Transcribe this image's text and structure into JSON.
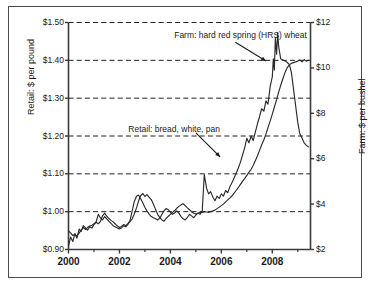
{
  "chart_data": {
    "type": "line",
    "title": "",
    "xlabel": "",
    "ylabel": "Retail: $ per pound",
    "y2label": "Farm: $ per bushel",
    "xlim": [
      2000.0,
      2009.5
    ],
    "ylim": [
      0.9,
      1.5
    ],
    "y2lim": [
      2,
      12
    ],
    "grid": true,
    "grid_style": "dashed-horizontal",
    "legend_position": "inline-annotations",
    "xticks": [
      2000,
      2002,
      2004,
      2006,
      2008
    ],
    "xticklabels": [
      "2000",
      "2002",
      "2004",
      "2006",
      "2008"
    ],
    "xminorticks": [
      2001,
      2003,
      2005,
      2007,
      2009
    ],
    "yticks": [
      0.9,
      1.0,
      1.1,
      1.2,
      1.3,
      1.4,
      1.5
    ],
    "yticklabels": [
      "$0.90",
      "$1.00",
      "$1.10",
      "$1.20",
      "$1.30",
      "$1.40",
      "$1.50"
    ],
    "y2ticks": [
      2,
      4,
      6,
      8,
      10,
      12
    ],
    "y2ticklabels": [
      "$2",
      "$4",
      "$6",
      "$8",
      "$10",
      "$12"
    ],
    "annotations": [
      {
        "text": "Farm: hard red spring (HRS) wheat",
        "text_x": 2004.15,
        "text_y": 1.463,
        "arrow_from_x": 2006.55,
        "arrow_from_y": 1.448,
        "arrow_to_x": 2007.75,
        "arrow_to_y": 1.398
      },
      {
        "text": "Retail: bread, white, pan",
        "text_x": 2002.35,
        "text_y": 1.215,
        "arrow_from_x": 2005.0,
        "arrow_from_y": 1.208,
        "arrow_to_x": 2005.95,
        "arrow_to_y": 1.145
      }
    ],
    "series": [
      {
        "name": "Retail: bread, white, pan",
        "axis": "left",
        "unit": "$ per pound",
        "color": "#2b2b2b",
        "x": [
          2000.0,
          2000.08,
          2000.17,
          2000.25,
          2000.33,
          2000.42,
          2000.5,
          2000.58,
          2000.67,
          2000.75,
          2000.83,
          2000.92,
          2001.0,
          2001.08,
          2001.17,
          2001.25,
          2001.33,
          2001.42,
          2001.5,
          2001.58,
          2001.67,
          2001.75,
          2001.83,
          2001.92,
          2002.0,
          2002.08,
          2002.17,
          2002.25,
          2002.33,
          2002.42,
          2002.5,
          2002.58,
          2002.67,
          2002.75,
          2002.83,
          2002.92,
          2003.0,
          2003.08,
          2003.17,
          2003.25,
          2003.33,
          2003.42,
          2003.5,
          2003.58,
          2003.67,
          2003.75,
          2003.83,
          2003.92,
          2004.0,
          2004.08,
          2004.17,
          2004.25,
          2004.33,
          2004.42,
          2004.5,
          2004.58,
          2004.67,
          2004.75,
          2004.83,
          2004.92,
          2005.0,
          2005.08,
          2005.17,
          2005.25,
          2005.33,
          2005.42,
          2005.5,
          2005.58,
          2005.67,
          2005.75,
          2005.83,
          2005.92,
          2006.0,
          2006.08,
          2006.17,
          2006.25,
          2006.33,
          2006.42,
          2006.5,
          2006.58,
          2006.67,
          2006.75,
          2006.83,
          2006.92,
          2007.0,
          2007.08,
          2007.17,
          2007.25,
          2007.33,
          2007.42,
          2007.5,
          2007.58,
          2007.67,
          2007.75,
          2007.83,
          2007.92,
          2008.0,
          2008.08,
          2008.17,
          2008.25,
          2008.33,
          2008.42,
          2008.5,
          2008.58,
          2008.67,
          2008.75,
          2008.83,
          2008.92,
          2009.0,
          2009.08,
          2009.17,
          2009.25,
          2009.33,
          2009.42
        ],
        "y": [
          0.949,
          0.944,
          0.937,
          0.94,
          0.935,
          0.944,
          0.951,
          0.958,
          0.953,
          0.958,
          0.962,
          0.964,
          0.968,
          0.972,
          0.968,
          0.974,
          0.988,
          0.996,
          0.988,
          0.982,
          0.977,
          0.973,
          0.968,
          0.962,
          0.958,
          0.961,
          0.966,
          0.963,
          0.968,
          0.974,
          0.981,
          0.993,
          1.01,
          1.028,
          1.042,
          1.048,
          1.04,
          1.045,
          1.038,
          1.032,
          1.02,
          1.006,
          0.993,
          0.985,
          0.978,
          0.975,
          0.982,
          0.988,
          0.993,
          0.998,
          1.003,
          1.009,
          1.014,
          1.018,
          1.021,
          1.016,
          1.01,
          1.005,
          1.0,
          0.996,
          0.994,
          0.996,
          0.998,
          0.998,
          1.0,
          0.999,
          0.998,
          1.0,
          1.002,
          1.004,
          1.008,
          1.012,
          1.016,
          1.02,
          1.026,
          1.031,
          1.036,
          1.042,
          1.049,
          1.056,
          1.064,
          1.072,
          1.08,
          1.088,
          1.096,
          1.104,
          1.112,
          1.122,
          1.134,
          1.148,
          1.162,
          1.176,
          1.19,
          1.205,
          1.222,
          1.24,
          1.258,
          1.276,
          1.296,
          1.316,
          1.334,
          1.352,
          1.368,
          1.38,
          1.388,
          1.392,
          1.394,
          1.396,
          1.398,
          1.401,
          1.396,
          1.402,
          1.398,
          1.4
        ]
      },
      {
        "name": "Farm: hard red spring (HRS) wheat",
        "axis": "right",
        "unit": "$ per bushel",
        "color": "#2b2b2b",
        "x": [
          2000.0,
          2000.08,
          2000.17,
          2000.25,
          2000.33,
          2000.42,
          2000.5,
          2000.58,
          2000.67,
          2000.75,
          2000.83,
          2000.92,
          2001.0,
          2001.08,
          2001.17,
          2001.25,
          2001.33,
          2001.42,
          2001.5,
          2001.58,
          2001.67,
          2001.75,
          2001.83,
          2001.92,
          2002.0,
          2002.08,
          2002.17,
          2002.25,
          2002.33,
          2002.42,
          2002.5,
          2002.58,
          2002.67,
          2002.75,
          2002.83,
          2002.92,
          2003.0,
          2003.08,
          2003.17,
          2003.25,
          2003.33,
          2003.42,
          2003.5,
          2003.58,
          2003.67,
          2003.75,
          2003.83,
          2003.92,
          2004.0,
          2004.08,
          2004.17,
          2004.25,
          2004.33,
          2004.42,
          2004.5,
          2004.58,
          2004.67,
          2004.75,
          2004.83,
          2004.92,
          2005.0,
          2005.08,
          2005.17,
          2005.25,
          2005.33,
          2005.42,
          2005.5,
          2005.58,
          2005.67,
          2005.75,
          2005.83,
          2005.92,
          2006.0,
          2006.08,
          2006.17,
          2006.25,
          2006.33,
          2006.42,
          2006.5,
          2006.58,
          2006.67,
          2006.75,
          2006.83,
          2006.92,
          2007.0,
          2007.08,
          2007.17,
          2007.25,
          2007.33,
          2007.42,
          2007.5,
          2007.58,
          2007.67,
          2007.75,
          2007.83,
          2007.92,
          2008.0,
          2008.04,
          2008.08,
          2008.12,
          2008.17,
          2008.21,
          2008.25,
          2008.33,
          2008.42,
          2008.5,
          2008.58,
          2008.67,
          2008.75,
          2008.83,
          2008.92,
          2009.0,
          2009.08,
          2009.17,
          2009.25,
          2009.33,
          2009.42
        ],
        "y": [
          2.15,
          2.55,
          2.35,
          2.7,
          2.5,
          2.9,
          2.8,
          3.05,
          2.95,
          2.85,
          3.0,
          2.95,
          3.1,
          3.2,
          3.55,
          3.4,
          3.3,
          3.45,
          3.35,
          3.25,
          3.15,
          3.05,
          3.0,
          2.95,
          2.9,
          2.95,
          3.05,
          3.0,
          3.1,
          3.3,
          3.7,
          4.1,
          4.35,
          4.4,
          4.25,
          4.05,
          3.85,
          3.7,
          3.55,
          3.45,
          3.4,
          3.35,
          3.3,
          3.38,
          3.55,
          3.7,
          3.8,
          3.75,
          3.65,
          3.55,
          3.62,
          3.7,
          3.6,
          3.45,
          3.35,
          3.3,
          3.42,
          3.55,
          3.48,
          3.4,
          3.52,
          3.6,
          3.55,
          3.7,
          5.3,
          4.7,
          4.45,
          4.55,
          4.3,
          4.15,
          4.35,
          4.25,
          4.45,
          4.35,
          4.6,
          4.5,
          4.75,
          4.95,
          5.15,
          5.35,
          5.6,
          5.85,
          6.15,
          6.5,
          6.9,
          6.7,
          7.0,
          6.8,
          7.15,
          7.55,
          7.85,
          8.2,
          8.1,
          8.55,
          8.4,
          9.2,
          9.6,
          10.4,
          9.9,
          11.3,
          10.6,
          11.55,
          10.95,
          10.4,
          10.35,
          10.3,
          10.25,
          10.15,
          9.8,
          9.1,
          8.3,
          7.6,
          7.1,
          6.9,
          6.7,
          6.6,
          6.52
        ]
      }
    ]
  },
  "axes": {
    "left_title": "Retail: $ per pound",
    "right_title": "Farm: $ per bushel"
  }
}
